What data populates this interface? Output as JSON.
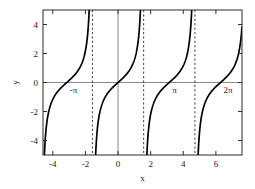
{
  "chart_data": {
    "type": "line",
    "title": "",
    "xlabel": "x",
    "ylabel": "y",
    "xlim": [
      -4.6,
      7.6
    ],
    "ylim": [
      -5.0,
      5.0
    ],
    "grid": false,
    "legend": null,
    "function": "y = tan(x)",
    "xticks": [
      -4,
      -2,
      0,
      2,
      4,
      6
    ],
    "xticklabels": [
      "-4",
      "-2",
      "0",
      "2",
      "4",
      "6"
    ],
    "yticks": [
      -4,
      -2,
      0,
      2,
      4
    ],
    "yticklabels": [
      "-4",
      "-2",
      "0",
      "2",
      "4"
    ],
    "asymptotes": [
      -1.5708,
      1.5708,
      4.7124
    ],
    "asymptote_labels": [
      "-pi/2",
      "pi/2",
      "3pi/2"
    ],
    "zero_crossings": [
      -3.1416,
      0,
      3.1416,
      6.2832
    ],
    "annotations": [
      {
        "text": "-π",
        "x": -3.1416,
        "y": -0.55
      },
      {
        "text": "π",
        "x": 3.1416,
        "y": -0.55
      },
      {
        "text": "2π",
        "x": 6.2832,
        "y": -0.55
      }
    ],
    "branches": [
      {
        "name": "branch-left-partial",
        "x_range": [
          -4.6,
          -1.5708
        ]
      },
      {
        "name": "branch-second",
        "x_range": [
          -1.5708,
          1.5708
        ]
      },
      {
        "name": "branch-third",
        "x_range": [
          1.5708,
          4.7124
        ]
      },
      {
        "name": "branch-right-partial",
        "x_range": [
          4.7124,
          7.6
        ]
      }
    ],
    "colors": {
      "curve": "#000000",
      "axis": "#8a8a8a",
      "frame": "#2b2b2b",
      "asymptote": "#2b2b2b",
      "background": "#ffffff"
    }
  }
}
